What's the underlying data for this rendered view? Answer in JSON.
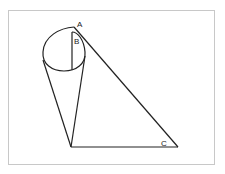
{
  "diagram": {
    "type": "geometry",
    "labels": {
      "A": "A",
      "B": "B",
      "C": "C"
    },
    "colors": {
      "stroke": "#222222",
      "frame": "#c8c8c8",
      "background": "#ffffff"
    }
  }
}
